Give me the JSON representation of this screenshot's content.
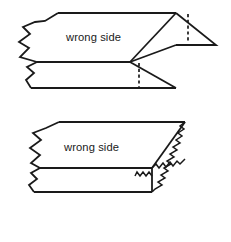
{
  "figure": {
    "background_color": "#ffffff",
    "line_color": "#1a1a1a",
    "panels": [
      {
        "id": "upper",
        "name": "folded-corner-figure",
        "label": "wrong side",
        "label_position": {
          "x": 66,
          "y": 41
        },
        "description": "Fabric piece shown with torn left edge, a corner folded back to the right forming a triangular flap, with dashed fold lines",
        "has_dashed_fold_lines": true,
        "dashed_fold_lines": [
          {
            "x": 188,
            "y1": 14,
            "y2": 40
          },
          {
            "x": 139,
            "y1": 64,
            "y2": 88
          }
        ],
        "edges": {
          "left": "torn-zigzag",
          "right": "folded-flap",
          "top": "straight",
          "bottom": "straight"
        }
      },
      {
        "id": "lower",
        "name": "pinked-edge-figure",
        "label": "wrong side",
        "label_position": {
          "x": 64,
          "y": 151
        },
        "description": "Fabric block shown with torn left edge and a pinked zigzag finished edge along the right end",
        "has_dashed_fold_lines": false,
        "edges": {
          "left": "torn-zigzag",
          "right": "pinked-zigzag",
          "top": "straight",
          "bottom": "straight"
        }
      }
    ]
  }
}
